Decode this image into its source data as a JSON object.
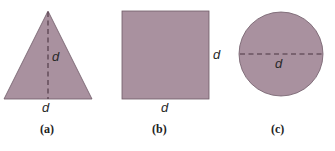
{
  "figure": {
    "colors": {
      "fill": "#a9919f",
      "outline": "#6f5b67",
      "dash": "#4a3440",
      "text": "#2a2a2a"
    },
    "panels": [
      {
        "id": "a",
        "shape": "triangle",
        "caption": "(a)",
        "labels": {
          "height": "d",
          "base": "d"
        }
      },
      {
        "id": "b",
        "shape": "square",
        "caption": "(b)",
        "labels": {
          "side": "d",
          "base": "d"
        }
      },
      {
        "id": "c",
        "shape": "circle",
        "caption": "(c)",
        "labels": {
          "diameter": "d"
        }
      }
    ]
  }
}
